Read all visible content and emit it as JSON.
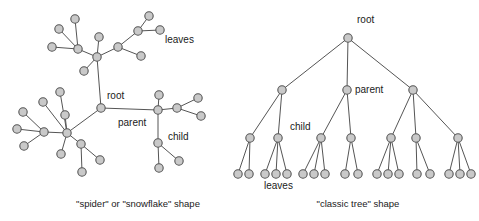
{
  "figure": {
    "background": "#ffffff",
    "node_fill": "#c9c9c9",
    "node_stroke": "#555555",
    "edge_color": "#555555",
    "text_color": "#1a1a1a"
  },
  "panels": [
    {
      "id": "spider",
      "caption": "\"spider\" or \"snowflake\" shape",
      "caption_x": 138,
      "caption_y": 207,
      "labels": [
        {
          "name": "root",
          "text": "root",
          "x": 107,
          "y": 99
        },
        {
          "name": "parent",
          "text": "parent",
          "x": 118,
          "y": 126
        },
        {
          "name": "child",
          "text": "child",
          "x": 168,
          "y": 140
        },
        {
          "name": "leaves",
          "text": "leaves",
          "x": 165,
          "y": 43
        }
      ],
      "nodes": [
        {
          "id": "root",
          "x": 101,
          "y": 108,
          "r": 4.2
        },
        {
          "id": "t_hub",
          "x": 97,
          "y": 57,
          "r": 4.2
        },
        {
          "id": "t_a",
          "x": 78,
          "y": 49,
          "r": 4.2
        },
        {
          "id": "t_a1",
          "x": 75,
          "y": 19,
          "r": 4.2
        },
        {
          "id": "t_a2",
          "x": 59,
          "y": 29,
          "r": 4.2
        },
        {
          "id": "t_a3",
          "x": 52,
          "y": 47,
          "r": 4.2
        },
        {
          "id": "t_b",
          "x": 99,
          "y": 37,
          "r": 4.2
        },
        {
          "id": "t_c",
          "x": 84,
          "y": 71,
          "r": 4.2
        },
        {
          "id": "t_d",
          "x": 118,
          "y": 47,
          "r": 4.2
        },
        {
          "id": "t_d1",
          "x": 141,
          "y": 56,
          "r": 4.2
        },
        {
          "id": "t_e",
          "x": 138,
          "y": 31,
          "r": 4.2
        },
        {
          "id": "t_e1",
          "x": 149,
          "y": 16,
          "r": 4.2
        },
        {
          "id": "t_e2",
          "x": 160,
          "y": 30,
          "r": 4.2
        },
        {
          "id": "l_hub",
          "x": 67,
          "y": 133,
          "r": 4.2
        },
        {
          "id": "l_sub",
          "x": 44,
          "y": 132,
          "r": 4.2
        },
        {
          "id": "l_s1",
          "x": 23,
          "y": 112,
          "r": 4.2
        },
        {
          "id": "l_s2",
          "x": 17,
          "y": 129,
          "r": 4.2
        },
        {
          "id": "l_s3",
          "x": 24,
          "y": 146,
          "r": 4.2
        },
        {
          "id": "l_a",
          "x": 43,
          "y": 102,
          "r": 4.2
        },
        {
          "id": "l_b",
          "x": 60,
          "y": 92,
          "r": 4.2
        },
        {
          "id": "l_c",
          "x": 65,
          "y": 115,
          "r": 4.2
        },
        {
          "id": "l_d",
          "x": 61,
          "y": 154,
          "r": 4.2
        },
        {
          "id": "l_e",
          "x": 81,
          "y": 144,
          "r": 4.2
        },
        {
          "id": "l_e1",
          "x": 100,
          "y": 160,
          "r": 4.2
        },
        {
          "id": "l_e2",
          "x": 82,
          "y": 172,
          "r": 4.2
        },
        {
          "id": "p_hub",
          "x": 158,
          "y": 110,
          "r": 4.2
        },
        {
          "id": "p_a",
          "x": 159,
          "y": 95,
          "r": 4.2
        },
        {
          "id": "p_b",
          "x": 177,
          "y": 108,
          "r": 4.2
        },
        {
          "id": "p_b1",
          "x": 198,
          "y": 98,
          "r": 4.2
        },
        {
          "id": "p_b2",
          "x": 201,
          "y": 116,
          "r": 4.2
        },
        {
          "id": "p_ch",
          "x": 158,
          "y": 143,
          "r": 4.2
        },
        {
          "id": "p_ch1",
          "x": 179,
          "y": 161,
          "r": 4.2
        },
        {
          "id": "p_ch2",
          "x": 159,
          "y": 168,
          "r": 4.2
        }
      ],
      "edges": [
        [
          "root",
          "t_hub"
        ],
        [
          "root",
          "l_hub"
        ],
        [
          "root",
          "p_hub"
        ],
        [
          "t_hub",
          "t_a"
        ],
        [
          "t_hub",
          "t_b"
        ],
        [
          "t_hub",
          "t_c"
        ],
        [
          "t_hub",
          "t_d"
        ],
        [
          "t_a",
          "t_a1"
        ],
        [
          "t_a",
          "t_a2"
        ],
        [
          "t_a",
          "t_a3"
        ],
        [
          "t_d",
          "t_d1"
        ],
        [
          "t_d",
          "t_e"
        ],
        [
          "t_e",
          "t_e1"
        ],
        [
          "t_e",
          "t_e2"
        ],
        [
          "l_hub",
          "l_sub"
        ],
        [
          "l_hub",
          "l_a"
        ],
        [
          "l_hub",
          "l_b"
        ],
        [
          "l_hub",
          "l_c"
        ],
        [
          "l_hub",
          "l_d"
        ],
        [
          "l_hub",
          "l_e"
        ],
        [
          "l_sub",
          "l_s1"
        ],
        [
          "l_sub",
          "l_s2"
        ],
        [
          "l_sub",
          "l_s3"
        ],
        [
          "l_e",
          "l_e1"
        ],
        [
          "l_e",
          "l_e2"
        ],
        [
          "p_hub",
          "p_a"
        ],
        [
          "p_hub",
          "p_b"
        ],
        [
          "p_hub",
          "p_ch"
        ],
        [
          "p_b",
          "p_b1"
        ],
        [
          "p_b",
          "p_b2"
        ],
        [
          "p_ch",
          "p_ch1"
        ],
        [
          "p_ch",
          "p_ch2"
        ]
      ]
    },
    {
      "id": "classic",
      "caption": "\"classic tree\" shape",
      "caption_x": 358,
      "caption_y": 207,
      "labels": [
        {
          "name": "root",
          "text": "root",
          "x": 357,
          "y": 23
        },
        {
          "name": "parent",
          "text": "parent",
          "x": 355,
          "y": 93
        },
        {
          "name": "child",
          "text": "child",
          "x": 290,
          "y": 130
        },
        {
          "name": "leaves",
          "text": "leaves",
          "x": 264,
          "y": 189
        }
      ],
      "nodes": [
        {
          "id": "r",
          "x": 348,
          "y": 38,
          "r": 4.2
        },
        {
          "id": "n1",
          "x": 282,
          "y": 90,
          "r": 4.2
        },
        {
          "id": "n2",
          "x": 347,
          "y": 90,
          "r": 4.2
        },
        {
          "id": "n3",
          "x": 413,
          "y": 90,
          "r": 4.2
        },
        {
          "id": "m1",
          "x": 250,
          "y": 138,
          "r": 4.2
        },
        {
          "id": "m2",
          "x": 278,
          "y": 138,
          "r": 4.2
        },
        {
          "id": "m3",
          "x": 321,
          "y": 138,
          "r": 4.2
        },
        {
          "id": "m4",
          "x": 351,
          "y": 138,
          "r": 4.2
        },
        {
          "id": "m5",
          "x": 391,
          "y": 138,
          "r": 4.2
        },
        {
          "id": "m6",
          "x": 416,
          "y": 138,
          "r": 4.2
        },
        {
          "id": "m7",
          "x": 458,
          "y": 138,
          "r": 4.2
        },
        {
          "id": "f1",
          "x": 238,
          "y": 174,
          "r": 4.2
        },
        {
          "id": "f2",
          "x": 249,
          "y": 174,
          "r": 4.2
        },
        {
          "id": "f3",
          "x": 265,
          "y": 174,
          "r": 4.2
        },
        {
          "id": "f4",
          "x": 276,
          "y": 174,
          "r": 4.2
        },
        {
          "id": "f5",
          "x": 287,
          "y": 174,
          "r": 4.2
        },
        {
          "id": "f6",
          "x": 303,
          "y": 174,
          "r": 4.2
        },
        {
          "id": "f7",
          "x": 314,
          "y": 174,
          "r": 4.2
        },
        {
          "id": "f8",
          "x": 325,
          "y": 174,
          "r": 4.2
        },
        {
          "id": "f9",
          "x": 345,
          "y": 174,
          "r": 4.2
        },
        {
          "id": "f10",
          "x": 358,
          "y": 174,
          "r": 4.2
        },
        {
          "id": "f11",
          "x": 377,
          "y": 174,
          "r": 4.2
        },
        {
          "id": "f12",
          "x": 388,
          "y": 174,
          "r": 4.2
        },
        {
          "id": "f13",
          "x": 399,
          "y": 174,
          "r": 4.2
        },
        {
          "id": "f14",
          "x": 417,
          "y": 174,
          "r": 4.2
        },
        {
          "id": "f15",
          "x": 430,
          "y": 174,
          "r": 4.2
        },
        {
          "id": "f16",
          "x": 449,
          "y": 174,
          "r": 4.2
        },
        {
          "id": "f17",
          "x": 460,
          "y": 174,
          "r": 4.2
        },
        {
          "id": "f18",
          "x": 471,
          "y": 174,
          "r": 4.2
        }
      ],
      "edges": [
        [
          "r",
          "n1"
        ],
        [
          "r",
          "n2"
        ],
        [
          "r",
          "n3"
        ],
        [
          "n1",
          "m1"
        ],
        [
          "n1",
          "m2"
        ],
        [
          "n2",
          "m3"
        ],
        [
          "n2",
          "m4"
        ],
        [
          "n3",
          "m5"
        ],
        [
          "n3",
          "m6"
        ],
        [
          "n3",
          "m7"
        ],
        [
          "m1",
          "f1"
        ],
        [
          "m1",
          "f2"
        ],
        [
          "m2",
          "f3"
        ],
        [
          "m2",
          "f4"
        ],
        [
          "m2",
          "f5"
        ],
        [
          "m3",
          "f6"
        ],
        [
          "m3",
          "f7"
        ],
        [
          "m3",
          "f8"
        ],
        [
          "m4",
          "f9"
        ],
        [
          "m4",
          "f10"
        ],
        [
          "m5",
          "f11"
        ],
        [
          "m5",
          "f12"
        ],
        [
          "m5",
          "f13"
        ],
        [
          "m6",
          "f14"
        ],
        [
          "m6",
          "f15"
        ],
        [
          "m7",
          "f16"
        ],
        [
          "m7",
          "f17"
        ],
        [
          "m7",
          "f18"
        ]
      ]
    }
  ]
}
